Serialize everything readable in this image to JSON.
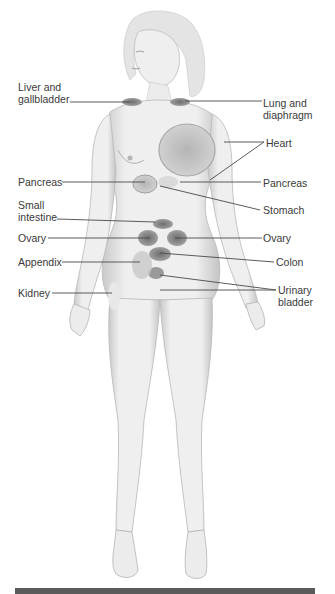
{
  "figure": {
    "labels_left": [
      {
        "id": "liver",
        "text": "Liver and\ngallbladder"
      },
      {
        "id": "pancreas-left",
        "text": "Pancreas"
      },
      {
        "id": "small-intestine",
        "text": "Small\nintestine"
      },
      {
        "id": "ovary-left",
        "text": "Ovary"
      },
      {
        "id": "appendix",
        "text": "Appendix"
      },
      {
        "id": "kidney",
        "text": "Kidney"
      }
    ],
    "labels_right": [
      {
        "id": "lung",
        "text": "Lung and\ndiaphragm"
      },
      {
        "id": "heart",
        "text": "Heart"
      },
      {
        "id": "pancreas-right",
        "text": "Pancreas"
      },
      {
        "id": "stomach",
        "text": "Stomach"
      },
      {
        "id": "ovary-right",
        "text": "Ovary"
      },
      {
        "id": "colon",
        "text": "Colon"
      },
      {
        "id": "bladder",
        "text": "Urinary\nbladder"
      }
    ]
  },
  "colors": {
    "label_text": "#3a3a3a",
    "leader_line": "#4a4a4a",
    "skin": "#ececec",
    "organ_shade": "#8a8a8a",
    "bottom_bar": "#5a5a5a"
  }
}
